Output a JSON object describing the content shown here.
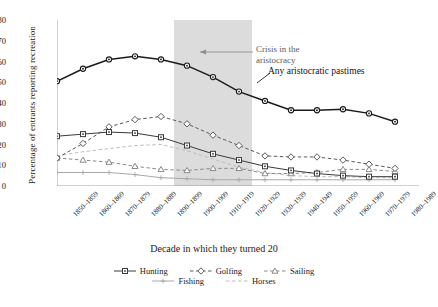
{
  "chart_data": {
    "type": "line",
    "title": "",
    "xlabel": "Decade in which they turned 20",
    "ylabel": "Percentage of entrants reporting recreation",
    "ylim": [
      0,
      80
    ],
    "yticks": [
      0,
      10,
      20,
      30,
      40,
      50,
      60,
      70,
      80
    ],
    "grid": false,
    "legend_position": "bottom",
    "categories": [
      "1850–1859",
      "1860–1869",
      "1870–1879",
      "1880–1889",
      "1890–1899",
      "1900–1909",
      "1910–1919",
      "1920–1929",
      "1930–1939",
      "1940–1949",
      "1950–1959",
      "1960–1969",
      "1970–1979",
      "1980–1989"
    ],
    "series": [
      {
        "name": "Any aristocratic pastimes",
        "marker": "circle",
        "dash": "solid",
        "color": "#1a1a1a",
        "in_legend": false,
        "values": [
          50.5,
          56.5,
          61.0,
          62.5,
          61.0,
          58.0,
          52.5,
          45.5,
          41.0,
          36.5,
          36.5,
          37.0,
          35.0,
          31.0
        ]
      },
      {
        "name": "Hunting",
        "marker": "square",
        "dash": "solid",
        "color": "#3a3a3a",
        "in_legend": true,
        "values": [
          24.0,
          25.0,
          26.0,
          25.5,
          23.5,
          19.5,
          15.5,
          12.5,
          9.5,
          7.5,
          6.0,
          5.0,
          4.5,
          4.5
        ]
      },
      {
        "name": "Golfing",
        "marker": "diamond",
        "dash": "dashed",
        "color": "#5a5a5a",
        "in_legend": true,
        "values": [
          13.5,
          20.5,
          28.5,
          32.0,
          33.5,
          30.0,
          24.5,
          19.5,
          14.5,
          14.0,
          14.0,
          12.5,
          10.5,
          8.5
        ]
      },
      {
        "name": "Sailing",
        "marker": "triangle",
        "dash": "dashed",
        "color": "#8a8a8a",
        "in_legend": true,
        "values": [
          13.5,
          12.5,
          11.5,
          9.5,
          8.0,
          7.5,
          8.5,
          8.5,
          6.0,
          6.0,
          6.5,
          8.0,
          8.0,
          7.0
        ]
      },
      {
        "name": "Fishing",
        "marker": "plus",
        "dash": "solid",
        "color": "#a8a8a8",
        "in_legend": true,
        "values": [
          6.5,
          6.5,
          6.5,
          5.5,
          4.0,
          3.5,
          3.0,
          3.0,
          3.0,
          3.0,
          3.0,
          3.0,
          3.0,
          3.0
        ]
      },
      {
        "name": "Horses",
        "marker": "none",
        "dash": "dashed",
        "color": "#bdbdbd",
        "in_legend": true,
        "values": [
          14.5,
          16.5,
          18.0,
          19.5,
          20.0,
          17.0,
          13.0,
          9.0,
          6.5,
          5.0,
          4.5,
          4.5,
          4.0,
          4.0
        ]
      }
    ],
    "shaded_band": {
      "label": "Crisis in the aristocracy",
      "from_category": "1900–1909",
      "to_category": "1920–1929",
      "color": "#dcdcdc"
    },
    "annotations": [
      {
        "id": "crisis",
        "line1": "Crisis in the",
        "line2": "aristocracy"
      },
      {
        "id": "pastimes",
        "text": "Any aristocratic pastimes"
      }
    ]
  },
  "legend": {
    "row1": [
      "Hunting",
      "Golfing",
      "Sailing"
    ],
    "row2": [
      "Fishing",
      "Horses"
    ]
  }
}
